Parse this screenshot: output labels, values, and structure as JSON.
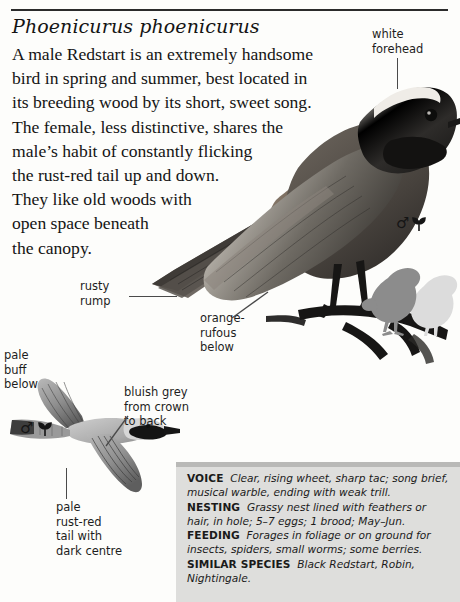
{
  "page": {
    "scientific_name": "Phoenicurus phoenicurus",
    "intro_lines": [
      "A male Redstart is an extremely handsome",
      "bird in spring and summer, best located in",
      "its breeding wood by its short, sweet song.",
      "The female, less distinctive, shares the",
      "male’s habit of constantly flicking",
      "the rust-red tail up and down.",
      "They like old woods with",
      "open space beneath",
      "the canopy."
    ]
  },
  "annotations": {
    "white_forehead": [
      "white",
      "forehead"
    ],
    "rusty_rump": [
      "rusty",
      "rump"
    ],
    "orange_rufous": [
      "orange-",
      "rufous",
      "below"
    ],
    "pale_buff": [
      "pale",
      "buff",
      "below"
    ],
    "bluish_grey": [
      "bluish grey",
      "from crown",
      "to back"
    ],
    "pale_rust_red": [
      "pale",
      "rust-red",
      "tail with",
      "dark centre"
    ]
  },
  "symbols": {
    "male": "♂",
    "leaf": "☣"
  },
  "info_box": {
    "entries": [
      {
        "key": "VOICE",
        "text_segments": [
          {
            "style": "italic",
            "text": "Clear, rising "
          },
          {
            "style": "roman",
            "text": "wheet"
          },
          {
            "style": "italic",
            "text": ", sharp "
          },
          {
            "style": "roman",
            "text": "tac"
          },
          {
            "style": "italic",
            "text": "; song brief, musical warble, ending with weak trill."
          }
        ],
        "plain": "Clear, rising wheet, sharp tac; song brief, musical warble, ending with weak trill."
      },
      {
        "key": "NESTING",
        "plain": "Grassy nest lined with feathers or hair, in hole; 5–7 eggs; 1 brood; May–Jun."
      },
      {
        "key": "FEEDING",
        "plain": "Forages in foliage or on ground for insects, spiders, small worms; some berries."
      },
      {
        "key": "SIMILAR SPECIES",
        "plain": "Black Redstart, Robin, Nightingale."
      }
    ]
  },
  "colors": {
    "page_background": "#fdfdfb",
    "rule": "#2b2b2b",
    "info_box_background": "#dededc",
    "info_box_top_strip": "#b9b9b7",
    "text": "#141414",
    "rust_red": "#b35a2a",
    "bluish_grey": "#8d96a0",
    "dark_plumage": "#2a2a2a",
    "silhouette": "#8c8c8c",
    "silhouette_ghost": "#dcdcdc"
  }
}
